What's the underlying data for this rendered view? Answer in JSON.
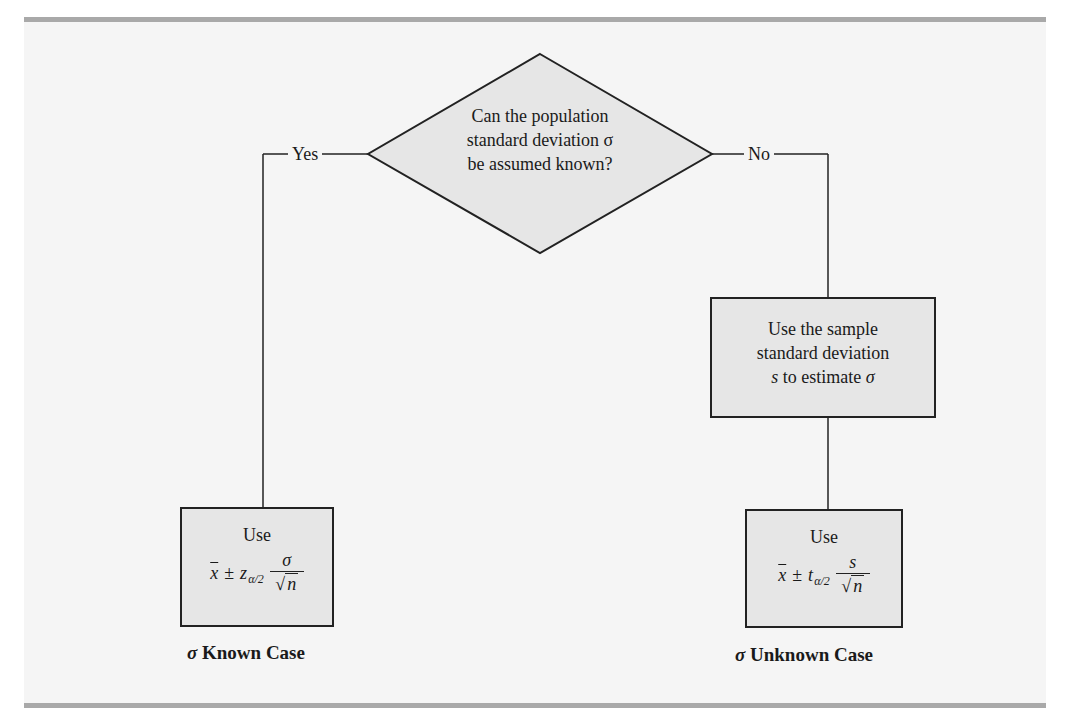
{
  "figure": {
    "background": "#f5f5f5",
    "rule_color": "#a9a9a9",
    "shape_fill": "#e6e6e6",
    "line_color": "#222222"
  },
  "decision": {
    "line1": "Can the population",
    "line2": "standard deviation σ",
    "line3": "be assumed known?"
  },
  "branches": {
    "yes_label": "Yes",
    "no_label": "No"
  },
  "estimate_box": {
    "line1": "Use the sample",
    "line2": "standard deviation",
    "line3_var": "s",
    "line3_text": " to estimate ",
    "line3_sym": "σ"
  },
  "known_box": {
    "use_label": "Use",
    "formula": {
      "xbar": "x",
      "pm": "±",
      "stat": "z",
      "sub": "α/2",
      "numerator": "σ",
      "radical": "√",
      "radicand": "n"
    }
  },
  "unknown_box": {
    "use_label": "Use",
    "formula": {
      "xbar": "x",
      "pm": "±",
      "stat": "t",
      "sub": "α/2",
      "numerator": "s",
      "radical": "√",
      "radicand": "n"
    }
  },
  "captions": {
    "known_sym": "σ",
    "known_text": " Known Case",
    "unknown_sym": "σ",
    "unknown_text": " Unknown Case"
  }
}
